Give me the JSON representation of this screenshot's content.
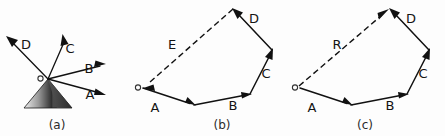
{
  "figure": {
    "background_color": "#fdfdfd",
    "ink_color": "#111111",
    "width": 445,
    "height": 136
  },
  "panels": [
    {
      "id": "a",
      "caption": "(a)",
      "caption_x": 57,
      "caption_y": 128,
      "description": "Four concurrent vectors radiating from common origin o with a shaded cone at the base",
      "origin_label": "o",
      "origin_label_x": 36,
      "origin_label_y": 82,
      "origin_x": 48,
      "origin_y": 79,
      "vectors": [
        {
          "name": "A",
          "label": "A",
          "label_x": 90,
          "label_y": 98,
          "tip_x": 104,
          "tip_y": 95,
          "direction": "right-down",
          "style": "solid"
        },
        {
          "name": "B",
          "label": "B",
          "label_x": 88,
          "label_y": 72,
          "tip_x": 104,
          "tip_y": 67,
          "direction": "right-slight-up",
          "style": "solid"
        },
        {
          "name": "C",
          "label": "C",
          "label_x": 68,
          "label_y": 53,
          "tip_x": 64,
          "tip_y": 36,
          "direction": "up-right",
          "style": "solid"
        },
        {
          "name": "D",
          "label": "D",
          "label_x": 26,
          "label_y": 49,
          "tip_x": 6,
          "tip_y": 38,
          "direction": "up-left",
          "style": "solid"
        }
      ],
      "cone": {
        "shape": "triangle",
        "apex_x": 48,
        "apex_y": 79,
        "base_left_x": 24,
        "base_left_y": 108,
        "base_right_x": 72,
        "base_right_y": 108,
        "shading": "gradient-light-left-to-dark-right",
        "light_color": "#e9e9e9",
        "mid_color": "#3a3a3a",
        "dark_color": "#555555"
      }
    },
    {
      "id": "b",
      "caption": "(b)",
      "caption_x": 222,
      "caption_y": 128,
      "description": "Closed vector polygon: head-to-tail vectors A, B, C, D closed by dashed vector E returning to o",
      "origin_label": "o",
      "origin_label_x": 133,
      "origin_label_y": 91,
      "vertices": {
        "o": {
          "x": 140,
          "y": 88
        },
        "p1": {
          "x": 194,
          "y": 105
        },
        "p2": {
          "x": 250,
          "y": 94
        },
        "p3": {
          "x": 272,
          "y": 50
        },
        "p4": {
          "x": 233,
          "y": 9
        }
      },
      "vectors": [
        {
          "name": "A",
          "label": "A",
          "label_x": 154,
          "label_y": 110,
          "from": "o",
          "to": "p1",
          "style": "solid",
          "arrow_at": "head"
        },
        {
          "name": "B",
          "label": "B",
          "label_x": 234,
          "label_y": 108,
          "from": "p1",
          "to": "p2",
          "style": "solid",
          "arrow_at": "head"
        },
        {
          "name": "C",
          "label": "C",
          "label_x": 265,
          "label_y": 77,
          "from": "p2",
          "to": "p3",
          "style": "solid",
          "arrow_at": "head"
        },
        {
          "name": "D",
          "label": "D",
          "label_x": 253,
          "label_y": 22,
          "from": "p3",
          "to": "p4",
          "style": "solid",
          "arrow_at": "head"
        },
        {
          "name": "E",
          "label": "E",
          "label_x": 172,
          "label_y": 48,
          "from": "p4",
          "to": "o",
          "style": "dashed",
          "arrow_at": "head"
        }
      ]
    },
    {
      "id": "c",
      "caption": "(c)",
      "caption_x": 365,
      "caption_y": 128,
      "description": "Same vector polygon with dashed resultant R drawn from o to the head of D",
      "origin_label": "o",
      "origin_label_x": 290,
      "origin_label_y": 91,
      "vertices": {
        "o": {
          "x": 297,
          "y": 88
        },
        "p1": {
          "x": 351,
          "y": 105
        },
        "p2": {
          "x": 407,
          "y": 94
        },
        "p3": {
          "x": 429,
          "y": 50
        },
        "p4": {
          "x": 390,
          "y": 9
        }
      },
      "vectors": [
        {
          "name": "A",
          "label": "A",
          "label_x": 311,
          "label_y": 110,
          "from": "o",
          "to": "p1",
          "style": "solid",
          "arrow_at": "head"
        },
        {
          "name": "B",
          "label": "B",
          "label_x": 391,
          "label_y": 108,
          "from": "p1",
          "to": "p2",
          "style": "solid",
          "arrow_at": "head"
        },
        {
          "name": "C",
          "label": "C",
          "label_x": 422,
          "label_y": 77,
          "from": "p2",
          "to": "p3",
          "style": "solid",
          "arrow_at": "head"
        },
        {
          "name": "D",
          "label": "D",
          "label_x": 410,
          "label_y": 22,
          "from": "p3",
          "to": "p4",
          "style": "solid",
          "arrow_at": "head"
        },
        {
          "name": "R",
          "label": "R",
          "label_x": 337,
          "label_y": 48,
          "from": "o",
          "to": "p4",
          "style": "dashed",
          "arrow_at": "head"
        }
      ]
    }
  ],
  "labels": {
    "A": "A",
    "B": "B",
    "C": "C",
    "D": "D",
    "E": "E",
    "R": "R",
    "origin": "o",
    "caption_a": "(a)",
    "caption_b": "(b)",
    "caption_c": "(c)"
  }
}
